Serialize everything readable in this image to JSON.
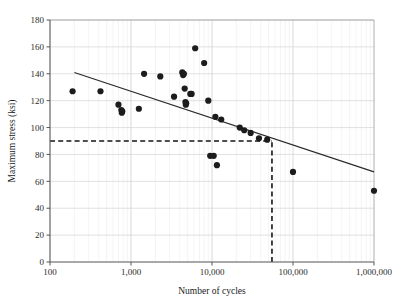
{
  "chart_data": {
    "type": "scatter",
    "title": "",
    "xlabel": "Number of cycles",
    "ylabel": "Maximum stress (ksi)",
    "xscale": "log",
    "yscale": "linear",
    "xlim": [
      100,
      1000000
    ],
    "ylim": [
      0,
      180
    ],
    "grid": true,
    "legend": null,
    "xticks": [
      100,
      1000,
      10000,
      100000,
      1000000
    ],
    "xtick_labels": [
      "100",
      "1,000",
      "10,000",
      "100,000",
      "1,000,000"
    ],
    "yticks": [
      0,
      20,
      40,
      60,
      80,
      100,
      120,
      140,
      160,
      180
    ],
    "ytick_labels": [
      "0",
      "20",
      "40",
      "60",
      "80",
      "100",
      "120",
      "140",
      "160",
      "180"
    ],
    "points": [
      {
        "x": 190,
        "y": 127
      },
      {
        "x": 420,
        "y": 127
      },
      {
        "x": 700,
        "y": 117
      },
      {
        "x": 760,
        "y": 113
      },
      {
        "x": 770,
        "y": 111
      },
      {
        "x": 780,
        "y": 112
      },
      {
        "x": 1250,
        "y": 114
      },
      {
        "x": 1450,
        "y": 140
      },
      {
        "x": 2300,
        "y": 138
      },
      {
        "x": 3400,
        "y": 123
      },
      {
        "x": 4300,
        "y": 141
      },
      {
        "x": 4400,
        "y": 139
      },
      {
        "x": 4500,
        "y": 140
      },
      {
        "x": 4600,
        "y": 129
      },
      {
        "x": 5400,
        "y": 125
      },
      {
        "x": 5600,
        "y": 125
      },
      {
        "x": 4700,
        "y": 119
      },
      {
        "x": 4750,
        "y": 117
      },
      {
        "x": 4800,
        "y": 118
      },
      {
        "x": 6200,
        "y": 159
      },
      {
        "x": 8000,
        "y": 148
      },
      {
        "x": 9000,
        "y": 120
      },
      {
        "x": 11000,
        "y": 108
      },
      {
        "x": 13000,
        "y": 106
      },
      {
        "x": 9500,
        "y": 79
      },
      {
        "x": 10500,
        "y": 79
      },
      {
        "x": 11500,
        "y": 72
      },
      {
        "x": 22000,
        "y": 100
      },
      {
        "x": 25000,
        "y": 98
      },
      {
        "x": 30000,
        "y": 96
      },
      {
        "x": 38000,
        "y": 92
      },
      {
        "x": 48000,
        "y": 91
      },
      {
        "x": 100000,
        "y": 67
      },
      {
        "x": 1000000,
        "y": 53
      }
    ],
    "trend_line": {
      "style": "solid",
      "color": "#2a2a2a",
      "x_start": 200,
      "y_start": 141,
      "x_end": 1000000,
      "y_end": 67
    },
    "reference_lines": [
      {
        "name": "endurance-stress-level",
        "orientation": "horizontal",
        "style": "dashed",
        "value": 90,
        "x_start": 100,
        "x_end": 55000
      },
      {
        "name": "endurance-cycle-count",
        "orientation": "vertical",
        "style": "dashed",
        "value": 55000,
        "y_start": 0,
        "y_end": 90
      }
    ],
    "marker": {
      "shape": "circle",
      "color": "#1c1c1c",
      "size": 3.1
    }
  }
}
